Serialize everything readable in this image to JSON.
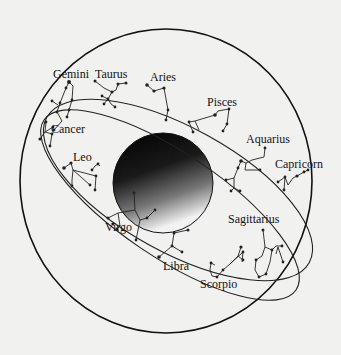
{
  "diagram": {
    "type": "zodiac-celestial-sphere",
    "background_color": "#f1f1f0",
    "line_color": "#222222",
    "central_body": {
      "name": "earth-sphere",
      "gradient": [
        "#000000",
        "#f5f5f5"
      ]
    },
    "constellations": [
      {
        "name": "Gemini",
        "label": "Gemini"
      },
      {
        "name": "Taurus",
        "label": "Taurus"
      },
      {
        "name": "Aries",
        "label": "Aries"
      },
      {
        "name": "Pisces",
        "label": "Pisces"
      },
      {
        "name": "Cancer",
        "label": "Cancer"
      },
      {
        "name": "Aquarius",
        "label": "Aquarius"
      },
      {
        "name": "Capricorn",
        "label": "Capricorn"
      },
      {
        "name": "Leo",
        "label": "Leo"
      },
      {
        "name": "Sagittarius",
        "label": "Sagittarius"
      },
      {
        "name": "Virgo",
        "label": "Virgo"
      },
      {
        "name": "Libra",
        "label": "Libra"
      },
      {
        "name": "Scorpio",
        "label": "Scorpio"
      }
    ]
  }
}
